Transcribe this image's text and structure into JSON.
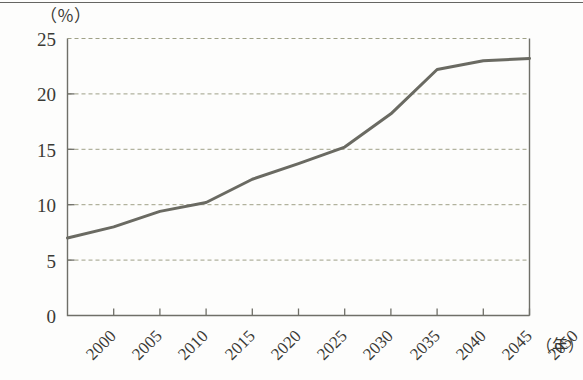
{
  "chart_data": {
    "type": "line",
    "title": "",
    "subtitle": "",
    "xlabel": "（年）",
    "ylabel": "（％）",
    "xlim": [
      2000,
      2050
    ],
    "ylim": [
      0,
      25
    ],
    "grid": true,
    "grid_axis": "y",
    "legend": false,
    "legend_position": "none",
    "x_tick_labels": [
      "2000",
      "2005",
      "2010",
      "2015",
      "2020",
      "2025",
      "2030",
      "2035",
      "2040",
      "2045",
      "2050"
    ],
    "y_tick_labels": [
      "0",
      "5",
      "10",
      "15",
      "20",
      "25"
    ],
    "y_ticks": [
      0,
      5,
      10,
      15,
      20,
      25
    ],
    "x_ticks": [
      2000,
      2005,
      2010,
      2015,
      2020,
      2025,
      2030,
      2035,
      2040,
      2045,
      2050
    ],
    "series": [
      {
        "name": "",
        "color": "#6a6a62",
        "x": [
          2000,
          2005,
          2010,
          2015,
          2020,
          2025,
          2030,
          2035,
          2040,
          2045,
          2050
        ],
        "values": [
          7.0,
          8.0,
          9.4,
          10.2,
          12.3,
          13.7,
          15.2,
          18.2,
          22.2,
          23.0,
          23.2
        ]
      }
    ]
  },
  "axes": {
    "y_unit_label": "（％）",
    "x_unit_label": "（年）"
  },
  "style": {
    "line_color": "#6a6a62",
    "grid_color": "#8f9173",
    "axis_color": "#6f6f68",
    "background": "#fdfdfc",
    "text_color": "#3a3a36"
  }
}
